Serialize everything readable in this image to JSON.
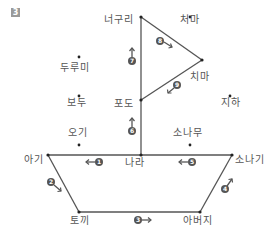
{
  "question_number": "3",
  "labels": {
    "neoguri": "너구리",
    "chima_top": "처마",
    "dubumi": "두루미",
    "chima": "치마",
    "bodu": "보두",
    "podo": "포도",
    "jiha": "지하",
    "ogi": "오기",
    "sonamu": "소나무",
    "agi": "아기",
    "nara": "나라",
    "sonagi": "소나기",
    "tokki": "토끼",
    "abeoji": "아버지"
  },
  "steps": [
    "1",
    "2",
    "3",
    "4",
    "5",
    "6",
    "7",
    "8",
    "9"
  ],
  "colors": {
    "line": "#555555",
    "circle": "#555555",
    "qnum_bg": "#9a9a9a"
  }
}
